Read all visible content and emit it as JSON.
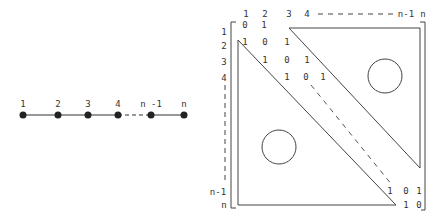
{
  "path_graph": {
    "nodes": [
      {
        "label": "1",
        "x": 23
      },
      {
        "label": "2",
        "x": 58
      },
      {
        "label": "3",
        "x": 88
      },
      {
        "label": "4",
        "x": 118
      },
      {
        "label": "n -1",
        "x": 151
      },
      {
        "label": "n",
        "x": 184
      }
    ],
    "node_y": 115,
    "label_y": 104,
    "dashed_segment": [
      "4",
      "n -1"
    ]
  },
  "matrix": {
    "col_labels": [
      {
        "text": "1",
        "x": 246
      },
      {
        "text": "2",
        "x": 265
      },
      {
        "text": "3",
        "x": 289
      },
      {
        "text": "4",
        "x": 307
      },
      {
        "text": "n-1",
        "x": 406
      },
      {
        "text": "n",
        "x": 423
      }
    ],
    "col_label_y": 14,
    "row_labels": [
      {
        "text": "1",
        "y": 32
      },
      {
        "text": "2",
        "y": 46
      },
      {
        "text": "3",
        "y": 62
      },
      {
        "text": "4",
        "y": 78
      },
      {
        "text": "n-1",
        "y": 192
      },
      {
        "text": "n",
        "y": 205
      }
    ],
    "row_label_x": 224,
    "entries": [
      {
        "text": "0",
        "x": 245,
        "y": 25
      },
      {
        "text": "1",
        "x": 264,
        "y": 25
      },
      {
        "text": "1",
        "x": 245,
        "y": 42
      },
      {
        "text": "0",
        "x": 265,
        "y": 42
      },
      {
        "text": "1",
        "x": 287,
        "y": 42
      },
      {
        "text": "1",
        "x": 265,
        "y": 60
      },
      {
        "text": "0",
        "x": 287,
        "y": 60
      },
      {
        "text": "1",
        "x": 307,
        "y": 60
      },
      {
        "text": "1",
        "x": 287,
        "y": 77
      },
      {
        "text": "0",
        "x": 306,
        "y": 77
      },
      {
        "text": "1",
        "x": 323,
        "y": 77
      },
      {
        "text": "1",
        "x": 390,
        "y": 191
      },
      {
        "text": "0",
        "x": 406,
        "y": 191
      },
      {
        "text": "1",
        "x": 419,
        "y": 191
      },
      {
        "text": "1",
        "x": 406,
        "y": 205
      },
      {
        "text": "0",
        "x": 419,
        "y": 205
      }
    ],
    "upper_zero_region": "circle",
    "lower_zero_region": "circle"
  }
}
